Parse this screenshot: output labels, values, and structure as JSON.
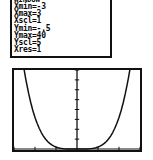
{
  "device": {
    "screen_label": "graphing-calculator"
  },
  "window_panel": {
    "header": "WINDOW",
    "settings": [
      {
        "name": "Xmin",
        "eq": "=",
        "value": "-3"
      },
      {
        "name": "Xmax",
        "eq": "=",
        "value": "3"
      },
      {
        "name": "Xscl",
        "eq": "=",
        "value": "1"
      },
      {
        "name": "Ymin",
        "eq": "=",
        "value": "-.5"
      },
      {
        "name": "Ymax",
        "eq": "=",
        "value": "40"
      },
      {
        "name": "Yscl",
        "eq": "=",
        "value": "5"
      },
      {
        "name": "Xres",
        "eq": "=",
        "value": "1"
      }
    ]
  },
  "chart_data": {
    "type": "line",
    "title": "",
    "xlabel": "",
    "ylabel": "",
    "xlim": [
      -3,
      3
    ],
    "ylim": [
      -0.5,
      40
    ],
    "xscl": 1,
    "yscl": 5,
    "grid": false,
    "legend": null,
    "axes": {
      "x_axis_y": 0,
      "y_axis_x": 0,
      "x_ticks": [
        -3,
        -2,
        -1,
        0,
        1,
        2,
        3
      ],
      "y_ticks": [
        0,
        5,
        10,
        15,
        20,
        25,
        30,
        35,
        40
      ]
    },
    "series": [
      {
        "name": "Y1",
        "expression": "x^4",
        "color": "#111111",
        "x": [
          -2.512,
          -2.45,
          -2.4,
          -2.3,
          -2.2,
          -2.1,
          -2.0,
          -1.9,
          -1.8,
          -1.7,
          -1.6,
          -1.5,
          -1.4,
          -1.3,
          -1.2,
          -1.1,
          -1.0,
          -0.9,
          -0.8,
          -0.7,
          -0.6,
          -0.5,
          -0.4,
          -0.3,
          -0.2,
          -0.1,
          0.0,
          0.1,
          0.2,
          0.3,
          0.4,
          0.5,
          0.6,
          0.7,
          0.8,
          0.9,
          1.0,
          1.1,
          1.2,
          1.3,
          1.4,
          1.5,
          1.6,
          1.7,
          1.8,
          1.9,
          2.0,
          2.1,
          2.2,
          2.3,
          2.4,
          2.45,
          2.512
        ],
        "y": [
          39.8,
          36.0,
          33.2,
          28.0,
          23.4,
          19.4,
          16.0,
          13.0,
          10.5,
          8.35,
          6.55,
          5.06,
          3.84,
          2.86,
          2.07,
          1.46,
          1.0,
          0.656,
          0.41,
          0.24,
          0.13,
          0.0625,
          0.0256,
          0.0081,
          0.0016,
          0.0001,
          0.0,
          0.0001,
          0.0016,
          0.0081,
          0.0256,
          0.0625,
          0.13,
          0.24,
          0.41,
          0.656,
          1.0,
          1.46,
          2.07,
          2.86,
          3.84,
          5.06,
          6.55,
          8.35,
          10.5,
          13.0,
          16.0,
          19.4,
          23.4,
          28.0,
          33.2,
          36.0,
          39.8
        ]
      }
    ]
  }
}
